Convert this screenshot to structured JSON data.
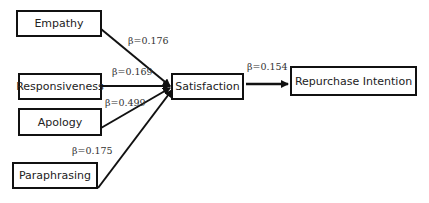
{
  "diagram": {
    "nodes": {
      "empathy": "Empathy",
      "responsiveness": "Responsiveness",
      "apology": "Apology",
      "paraphrasing": "Paraphrasing",
      "satisfaction": "Satisfaction",
      "repurchase": "Repurchase Intention"
    },
    "paths": {
      "empathy_satisfaction": "β=0.176",
      "responsiveness_satisfaction": "β=0.169",
      "apology_satisfaction": "β=0.499",
      "paraphrasing_satisfaction": "β=0.175",
      "satisfaction_repurchase": "β=0.154"
    },
    "colors": {
      "line": "#111111",
      "box_border": "#111111",
      "text": "#222222"
    }
  }
}
